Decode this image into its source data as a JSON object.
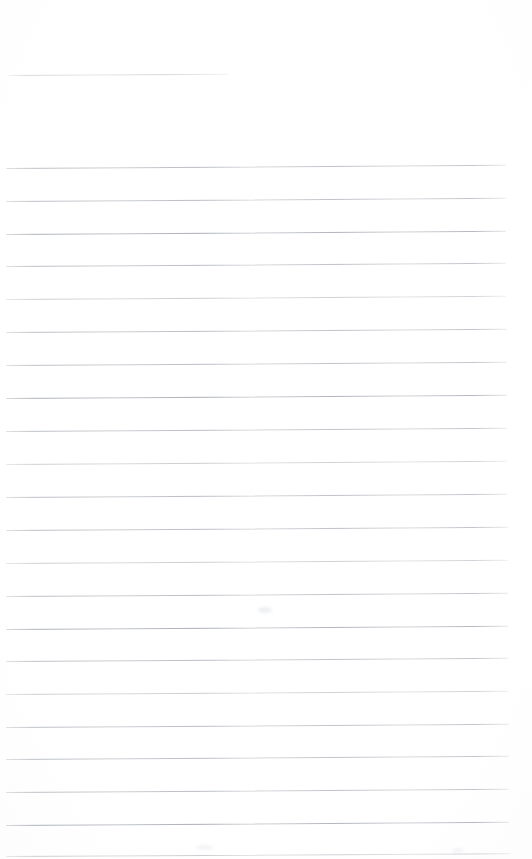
{
  "document": {
    "kind": "scanned-lined-notebook-page",
    "title": "Blank Lined Page",
    "background_color": "#ffffff",
    "rule_color": "#b9bdc2",
    "width_px": 532,
    "height_px": 859,
    "body_text": "",
    "handwriting_present": "none",
    "page_number": "",
    "header_text": "",
    "footer_text": ""
  },
  "header_rule": {
    "name": "top-short-rule",
    "x": 8,
    "y": 75,
    "length": 220,
    "tilt_deg": -0.35,
    "weight": "faint"
  },
  "ruled_lines": [
    {
      "index": 1,
      "x": 6,
      "y": 168,
      "length": 500,
      "tilt_deg": -0.36,
      "weight": "mid"
    },
    {
      "index": 2,
      "x": 6,
      "y": 201,
      "length": 500,
      "tilt_deg": -0.36,
      "weight": "mid"
    },
    {
      "index": 3,
      "x": 6,
      "y": 234,
      "length": 500,
      "tilt_deg": -0.36,
      "weight": "strong"
    },
    {
      "index": 4,
      "x": 6,
      "y": 266,
      "length": 500,
      "tilt_deg": -0.36,
      "weight": "mid"
    },
    {
      "index": 5,
      "x": 6,
      "y": 299,
      "length": 500,
      "tilt_deg": -0.36,
      "weight": "faint"
    },
    {
      "index": 6,
      "x": 6,
      "y": 332,
      "length": 501,
      "tilt_deg": -0.36,
      "weight": "mid"
    },
    {
      "index": 7,
      "x": 6,
      "y": 365,
      "length": 501,
      "tilt_deg": -0.36,
      "weight": "mid"
    },
    {
      "index": 8,
      "x": 6,
      "y": 398,
      "length": 501,
      "tilt_deg": -0.36,
      "weight": "strong"
    },
    {
      "index": 9,
      "x": 6,
      "y": 431,
      "length": 501,
      "tilt_deg": -0.36,
      "weight": "mid"
    },
    {
      "index": 10,
      "x": 6,
      "y": 464,
      "length": 501,
      "tilt_deg": -0.36,
      "weight": "faint"
    },
    {
      "index": 11,
      "x": 6,
      "y": 497,
      "length": 501,
      "tilt_deg": -0.36,
      "weight": "mid"
    },
    {
      "index": 12,
      "x": 6,
      "y": 530,
      "length": 502,
      "tilt_deg": -0.36,
      "weight": "mid"
    },
    {
      "index": 13,
      "x": 6,
      "y": 563,
      "length": 502,
      "tilt_deg": -0.36,
      "weight": "faint"
    },
    {
      "index": 14,
      "x": 6,
      "y": 596,
      "length": 502,
      "tilt_deg": -0.36,
      "weight": "mid"
    },
    {
      "index": 15,
      "x": 6,
      "y": 629,
      "length": 502,
      "tilt_deg": -0.36,
      "weight": "strong"
    },
    {
      "index": 16,
      "x": 6,
      "y": 661,
      "length": 502,
      "tilt_deg": -0.36,
      "weight": "mid"
    },
    {
      "index": 17,
      "x": 6,
      "y": 694,
      "length": 502,
      "tilt_deg": -0.36,
      "weight": "faint"
    },
    {
      "index": 18,
      "x": 6,
      "y": 727,
      "length": 503,
      "tilt_deg": -0.36,
      "weight": "mid"
    },
    {
      "index": 19,
      "x": 6,
      "y": 759,
      "length": 503,
      "tilt_deg": -0.36,
      "weight": "mid"
    },
    {
      "index": 20,
      "x": 6,
      "y": 792,
      "length": 503,
      "tilt_deg": -0.36,
      "weight": "mid"
    },
    {
      "index": 21,
      "x": 6,
      "y": 825,
      "length": 503,
      "tilt_deg": -0.36,
      "weight": "strong"
    },
    {
      "index": 22,
      "x": 6,
      "y": 856,
      "length": 505,
      "tilt_deg": -0.3,
      "weight": "faint"
    }
  ],
  "smudges": [
    {
      "name": "scan-smudge-center",
      "x": 258,
      "y": 607,
      "w": 14,
      "h": 6,
      "color": "rgba(200,203,208,0.30)"
    },
    {
      "name": "scan-smudge-lower",
      "x": 196,
      "y": 845,
      "w": 18,
      "h": 5,
      "color": "rgba(204,207,212,0.22)"
    },
    {
      "name": "scan-smudge-right",
      "x": 452,
      "y": 848,
      "w": 12,
      "h": 5,
      "color": "rgba(204,207,212,0.20)"
    }
  ]
}
